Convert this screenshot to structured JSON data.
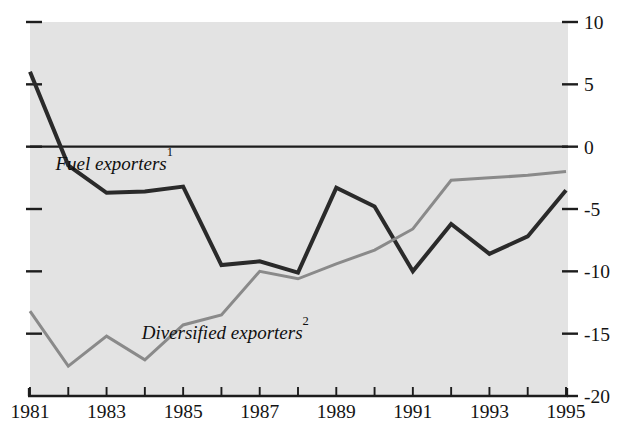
{
  "chart_data": {
    "type": "line",
    "title": "",
    "subtitle": "",
    "xlabel": "",
    "ylabel": "",
    "x": [
      1981,
      1982,
      1983,
      1984,
      1985,
      1986,
      1987,
      1988,
      1989,
      1990,
      1991,
      1992,
      1993,
      1994,
      1995
    ],
    "xlim": [
      1981,
      1995
    ],
    "ylim": [
      -20,
      10
    ],
    "grid": false,
    "legend_position": "inline-annotation",
    "y_axis_side": "right",
    "x_tick_labels": [
      "1981",
      "1983",
      "1985",
      "1987",
      "1989",
      "1991",
      "1993",
      "1995"
    ],
    "x_tick_values": [
      1981,
      1983,
      1985,
      1987,
      1989,
      1991,
      1993,
      1995
    ],
    "x_minor_tick_values": [
      1982,
      1984,
      1986,
      1988,
      1990,
      1992,
      1994
    ],
    "y_tick_labels": [
      "10",
      "5",
      "0",
      "-5",
      "-10",
      "-15",
      "-20"
    ],
    "y_tick_values": [
      10,
      5,
      0,
      -5,
      -10,
      -15,
      -20
    ],
    "series": [
      {
        "name": "Fuel exporters",
        "footnote": "1",
        "color": "#2a2a2a",
        "values": [
          6.0,
          -1.5,
          -3.7,
          -3.6,
          -3.2,
          -9.5,
          -9.2,
          -10.1,
          -3.3,
          -4.8,
          -10.0,
          -6.2,
          -8.6,
          -7.2,
          -3.5
        ]
      },
      {
        "name": "Diversified exporters",
        "footnote": "2",
        "color": "#8a8a8a",
        "values": [
          -13.2,
          -17.6,
          -15.2,
          -17.1,
          -14.3,
          -13.5,
          -10.0,
          -10.6,
          -9.4,
          -8.3,
          -6.6,
          -2.7,
          -2.5,
          -2.3,
          -2.0
        ]
      }
    ],
    "annotations": [
      {
        "text": "Fuel exporters",
        "footnote": "1",
        "x": 1983.2,
        "y": -1.9
      },
      {
        "text": "Diversified exporters",
        "footnote": "2",
        "x": 1986.1,
        "y": -15.4
      }
    ]
  },
  "colors": {
    "plot_background": "#e3e3e3",
    "page_background": "#ffffff",
    "axis": "#1d1d1d",
    "fuel_line": "#2a2a2a",
    "diversified_line": "#8a8a8a"
  }
}
